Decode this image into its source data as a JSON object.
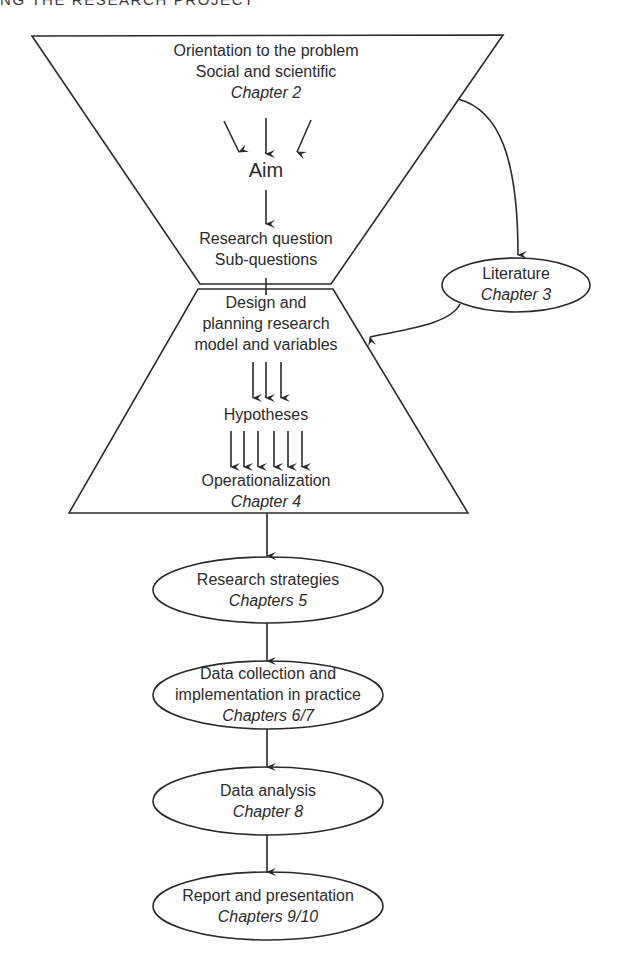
{
  "header": {
    "running_title": "NG THE RESEARCH PROJECT"
  },
  "colors": {
    "stroke": "#2a2a2a",
    "text": "#2b2b2b",
    "background": "#ffffff"
  },
  "diagram": {
    "top_funnel": {
      "line1": "Orientation to the problem",
      "line2": "Social and scientific",
      "chapter": "Chapter 2",
      "aim": "Aim",
      "rq_line1": "Research question",
      "rq_line2": "Sub-questions"
    },
    "literature": {
      "label": "Literature",
      "chapter": "Chapter 3"
    },
    "design_trapezoid": {
      "line1": "Design and",
      "line2": "planning research",
      "line3": "model and variables",
      "hypotheses": "Hypotheses",
      "operationalization": "Operationalization",
      "chapter": "Chapter 4"
    },
    "steps": [
      {
        "lines": [
          "Research strategies"
        ],
        "chapter": "Chapters 5"
      },
      {
        "lines": [
          "Data collection and",
          "implementation in practice"
        ],
        "chapter": "Chapters 6/7"
      },
      {
        "lines": [
          "Data analysis"
        ],
        "chapter": "Chapter 8"
      },
      {
        "lines": [
          "Report and presentation"
        ],
        "chapter": "Chapters 9/10"
      }
    ]
  }
}
